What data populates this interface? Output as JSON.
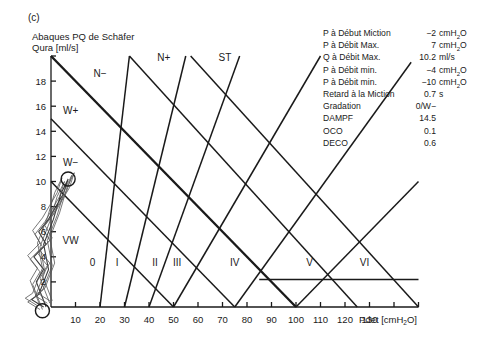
{
  "panel_label": "(c)",
  "title": {
    "line1": "Abaques PQ de Schäfer",
    "line2": "Qura [ml/s]"
  },
  "xlabel": "Pdet [cmH2O]",
  "parameters": [
    {
      "label": "P à Début Miction",
      "value": "−2",
      "unit": "cmH2O"
    },
    {
      "label": "P à Débit Max.",
      "value": "7",
      "unit": "cmH2O"
    },
    {
      "label": "Q à Débit Max.",
      "value": "10.2",
      "unit": "ml/s"
    },
    {
      "label": "P à Débit min.",
      "value": "−4",
      "unit": "cmH2O"
    },
    {
      "label": "P à Débit min.",
      "value": "−10",
      "unit": "cmH2O"
    },
    {
      "label": "Retard à la Miction",
      "value": "0.7",
      "unit": "s"
    },
    {
      "label": "Gradation",
      "value": "0/W−",
      "unit": ""
    },
    {
      "label": "DAMPF",
      "value": "14.5",
      "unit": ""
    },
    {
      "label": "OCO",
      "value": "0.1",
      "unit": ""
    },
    {
      "label": "DECO",
      "value": "0.6",
      "unit": ""
    }
  ],
  "chart_data": {
    "type": "line",
    "title": "Abaques PQ de Schäfer",
    "xlabel": "Pdet [cmH2O]",
    "ylabel": "Qura [ml/s]",
    "xlim": [
      0,
      150
    ],
    "ylim": [
      0,
      20
    ],
    "x_ticks": [
      10,
      20,
      30,
      40,
      50,
      60,
      70,
      80,
      90,
      100,
      110,
      120,
      130,
      140,
      150
    ],
    "x_tick_labels": [
      "10",
      "20",
      "30",
      "40",
      "50",
      "60",
      "70",
      "80",
      "90",
      "100",
      "110",
      "120",
      "130"
    ],
    "y_ticks": [
      2,
      4,
      6,
      8,
      10,
      12,
      14,
      16,
      18
    ],
    "y_tick_labels": [
      "2",
      "4",
      "6",
      "8",
      "10",
      "12",
      "14",
      "16",
      "18"
    ],
    "grid": false,
    "nomogram_lines": [
      {
        "name": "W− / VW boundary",
        "points": [
          [
            0,
            10
          ],
          [
            50,
            0
          ]
        ],
        "weight": "normal"
      },
      {
        "name": "W+ / W− boundary",
        "points": [
          [
            0,
            15
          ],
          [
            75,
            0
          ]
        ],
        "weight": "normal"
      },
      {
        "name": "N− / W+ boundary",
        "points": [
          [
            0,
            20
          ],
          [
            100,
            0
          ]
        ],
        "weight": "bold"
      },
      {
        "name": "N+ / N− boundary",
        "points": [
          [
            32,
            20
          ],
          [
            125,
            0
          ]
        ],
        "weight": "normal"
      },
      {
        "name": "ST / N+ boundary",
        "points": [
          [
            57,
            20
          ],
          [
            150,
            0
          ]
        ],
        "weight": "normal"
      },
      {
        "name": "grade 0/I",
        "points": [
          [
            20,
            0
          ],
          [
            32,
            20
          ]
        ],
        "weight": "normal"
      },
      {
        "name": "grade I/II",
        "points": [
          [
            30,
            0
          ],
          [
            55,
            20
          ]
        ],
        "weight": "normal"
      },
      {
        "name": "grade II/III",
        "points": [
          [
            40,
            0
          ],
          [
            77,
            20
          ]
        ],
        "weight": "normal"
      },
      {
        "name": "grade III/IV",
        "points": [
          [
            50,
            0
          ],
          [
            110,
            20
          ]
        ],
        "weight": "normal"
      },
      {
        "name": "grade IV/V",
        "points": [
          [
            75,
            0
          ],
          [
            147,
            19.5
          ]
        ],
        "weight": "normal"
      },
      {
        "name": "grade V/VI",
        "points": [
          [
            100,
            0
          ],
          [
            150,
            10
          ]
        ],
        "weight": "normal"
      },
      {
        "name": "horizontal",
        "points": [
          [
            85,
            2.2
          ],
          [
            150,
            2.2
          ]
        ],
        "weight": "normal"
      }
    ],
    "zone_labels": [
      {
        "text": "N−",
        "x": 20,
        "y": 18.3
      },
      {
        "text": "N+",
        "x": 46,
        "y": 19.6
      },
      {
        "text": "ST",
        "x": 71,
        "y": 19.6
      },
      {
        "text": "W+",
        "x": 8,
        "y": 15.4
      },
      {
        "text": "W−",
        "x": 8,
        "y": 11.2
      },
      {
        "text": "VW",
        "x": 8,
        "y": 5
      },
      {
        "text": "0",
        "x": 17,
        "y": 3.3
      },
      {
        "text": "I",
        "x": 27,
        "y": 3.3
      },
      {
        "text": "II",
        "x": 42.5,
        "y": 3.3
      },
      {
        "text": "III",
        "x": 51.5,
        "y": 3.3
      },
      {
        "text": "IV",
        "x": 75,
        "y": 3.3
      },
      {
        "text": "V",
        "x": 105.5,
        "y": 3.3
      },
      {
        "text": "VI",
        "x": 128,
        "y": 3.3
      }
    ],
    "annotations": [
      {
        "type": "circle",
        "label": "Qmax marker",
        "x": 7,
        "y": 10.2
      },
      {
        "type": "circle",
        "label": "start marker",
        "x": -3.5,
        "y": -0.3
      }
    ],
    "pq_curve": [
      [
        -2,
        0
      ],
      [
        -4,
        1
      ],
      [
        -6,
        2
      ],
      [
        -3,
        3
      ],
      [
        -7,
        4
      ],
      [
        -2,
        5
      ],
      [
        -5,
        6
      ],
      [
        -1,
        7
      ],
      [
        2,
        8
      ],
      [
        5,
        9
      ],
      [
        7,
        10.2
      ],
      [
        4,
        9
      ],
      [
        1,
        7
      ],
      [
        -3,
        5
      ],
      [
        -1,
        3
      ],
      [
        -5,
        1
      ],
      [
        -8,
        0.6
      ],
      [
        -3,
        0
      ]
    ]
  }
}
